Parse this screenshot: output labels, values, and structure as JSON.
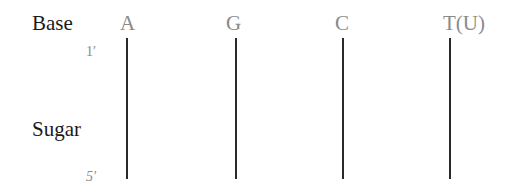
{
  "diagram": {
    "row_labels": {
      "base": "Base",
      "sugar": "Sugar"
    },
    "position_labels": {
      "top": "1′",
      "bottom": "5′"
    },
    "bases": [
      {
        "label": "A",
        "x": 127
      },
      {
        "label": "G",
        "x": 236
      },
      {
        "label": "C",
        "x": 343
      },
      {
        "label": "T(U)",
        "x": 450
      }
    ],
    "colors": {
      "row_label": "#1a1a1a",
      "base_label": "#8a8a8a",
      "prime_label": "#8a8a8a",
      "strand_line": "#2a2a2a"
    }
  }
}
